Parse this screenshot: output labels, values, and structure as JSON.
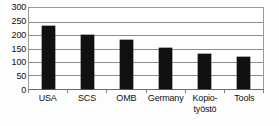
{
  "chart_data": {
    "type": "bar",
    "title": "",
    "xlabel": "",
    "ylabel": "",
    "categories": [
      "USA",
      "SCS",
      "OMB",
      "Germany",
      "Kopio-työstö",
      "Tools"
    ],
    "category_lines": [
      [
        "USA"
      ],
      [
        "SCS"
      ],
      [
        "OMB"
      ],
      [
        "Germany"
      ],
      [
        "Kopio-",
        "työstö"
      ],
      [
        "Tools"
      ]
    ],
    "values": [
      235,
      200,
      180,
      153,
      130,
      120
    ],
    "ylim": [
      0,
      300
    ],
    "ytick_step": 50,
    "yticks": [
      300,
      250,
      200,
      150,
      100,
      50,
      0
    ],
    "ytick_labels": [
      "300",
      "250",
      "200",
      "150",
      "100",
      "50",
      "0"
    ],
    "grid": true,
    "grid_axis": "y",
    "legend": false,
    "legend_position": "none",
    "bar_color": "#111111",
    "grid_color": "#8d8d8d",
    "frame_color": "#9a9a9a",
    "background_color": "#ffffff"
  }
}
